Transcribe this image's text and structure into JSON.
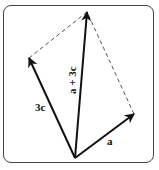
{
  "diagram": {
    "type": "vector-parallelogram",
    "colors": {
      "vector": "#111111",
      "dashed": "#555555",
      "frame": "#444444",
      "background": "#ffffff"
    },
    "origin": [
      75,
      158
    ],
    "vectors": [
      {
        "id": "a",
        "label": "a",
        "tip": [
          134,
          114
        ]
      },
      {
        "id": "3c",
        "label": "3c",
        "tip": [
          29,
          58
        ]
      },
      {
        "id": "sum",
        "label": "a + 3c",
        "tip": [
          87,
          12
        ]
      }
    ],
    "dashed_edges": [
      {
        "from": [
          29,
          58
        ],
        "to": [
          87,
          12
        ]
      },
      {
        "from": [
          134,
          114
        ],
        "to": [
          87,
          12
        ]
      }
    ]
  }
}
